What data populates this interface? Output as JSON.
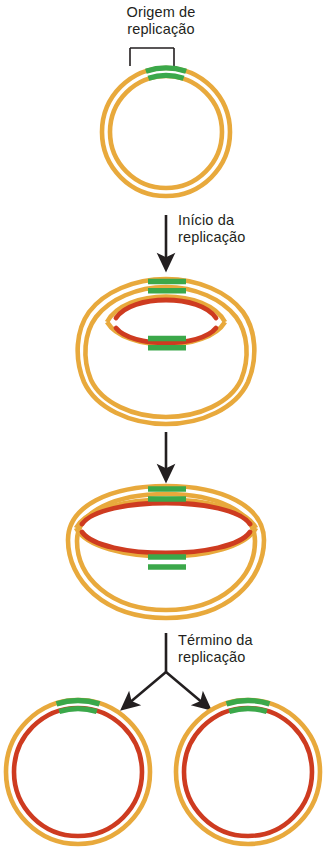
{
  "figure": {
    "language": "pt-BR",
    "background_color": "#ffffff"
  },
  "colors": {
    "parental_strand": "#E8A93C",
    "parental_strand_light": "#EFC06A",
    "new_strand": "#CE3B20",
    "origin_segment": "#3BA84A",
    "origin_segment_light": "#6EC25A",
    "arrow": "#231f20",
    "bracket": "#231f20",
    "text": "#231f20"
  },
  "labels": {
    "origin": "Origem de\nreplicação",
    "initiation": "Início da\nreplicação",
    "termination": "Término da\nreplicação"
  },
  "legend_semantics": {
    "orange": "Fita parental (molde)",
    "red": "Fita recém-sintetizada",
    "green": "Origem de replicação (oriC)"
  },
  "stages": [
    {
      "id": "stage-1",
      "name": "cromossomo-circular-intacto",
      "order": 1,
      "description": "Cromossomo circular de fita dupla com a origem de replicação marcada em verde no topo.",
      "elements": [
        "anel-externo-laranja",
        "anel-interno-laranja",
        "segmento-origem-verde-externo",
        "segmento-origem-verde-interno",
        "colchete-origem"
      ]
    },
    {
      "id": "stage-2",
      "name": "bolha-de-replicacao-inicial",
      "order": 2,
      "description": "Pequena bolha de replicação bidirecional formada na origem; novas fitas vermelhas sintetizadas em ambas as direções.",
      "elements": [
        "arco-superior",
        "arco-inferior",
        "fitas-novas-vermelhas",
        "quatro-segmentos-origem-verdes"
      ]
    },
    {
      "id": "stage-3",
      "name": "estrutura-theta-expandida",
      "order": 3,
      "description": "A bolha de replicação se expandiu; a molécula assume a forma da letra grega theta.",
      "elements": [
        "arco-superior-expandido",
        "arco-inferior-expandido",
        "fitas-novas-vermelhas-longas",
        "segmentos-origem-verdes"
      ]
    },
    {
      "id": "stage-4",
      "name": "dois-cromossomos-filhos",
      "order": 4,
      "description": "Duas moléculas circulares filhas idênticas, cada uma com uma fita parental laranja e uma fita nova vermelha.",
      "elements": [
        "circulo-filho-esquerdo",
        "circulo-filho-direito"
      ]
    }
  ],
  "arrows": [
    {
      "id": "arrow-1",
      "name": "seta-inicio-replicacao",
      "label_key": "initiation",
      "from_stage": "stage-1",
      "to_stage": "stage-2",
      "has_label": true
    },
    {
      "id": "arrow-2",
      "name": "seta-progressao",
      "label_key": null,
      "from_stage": "stage-2",
      "to_stage": "stage-3",
      "has_label": false
    },
    {
      "id": "arrow-3",
      "name": "seta-termino-replicacao-bifurcada",
      "label_key": "termination",
      "from_stage": "stage-3",
      "to_stage": "stage-4",
      "has_label": true,
      "branches": 2
    }
  ]
}
